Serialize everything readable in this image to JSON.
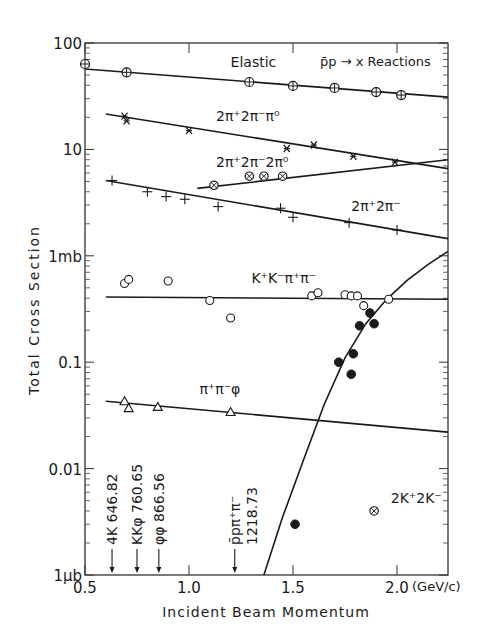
{
  "chart_data": {
    "type": "scatter",
    "title": "p̄p → x Reactions",
    "xlabel": "Incident Beam Momentum",
    "xunit": "(GeV/c)",
    "ylabel": "Total Cross Section",
    "xscale": "linear",
    "yscale": "log",
    "xlim": [
      0.5,
      2.245
    ],
    "ylim": [
      0.001,
      100
    ],
    "x_ticks": [
      {
        "value": 0.5,
        "label": "0.5"
      },
      {
        "value": 1.0,
        "label": "1.0"
      },
      {
        "value": 1.5,
        "label": "1.5"
      },
      {
        "value": 2.0,
        "label": "2.0"
      }
    ],
    "y_ticks": [
      {
        "value": 100,
        "label": "100"
      },
      {
        "value": 10,
        "label": "10"
      },
      {
        "value": 1,
        "label": "1mb"
      },
      {
        "value": 0.1,
        "label": "0.1"
      },
      {
        "value": 0.01,
        "label": "0.01"
      },
      {
        "value": 0.001,
        "label": "1μb"
      }
    ],
    "grid": false,
    "series": [
      {
        "name": "Elastic",
        "marker": "circle-plus",
        "label": {
          "text": "Elastic",
          "x": 1.2,
          "y": 60
        },
        "points": [
          [
            0.5,
            63.5
          ],
          [
            0.7,
            53
          ],
          [
            1.29,
            43
          ],
          [
            1.5,
            39.5
          ],
          [
            1.7,
            37.8
          ],
          [
            1.9,
            34.6
          ],
          [
            2.02,
            32.4
          ]
        ],
        "fit": [
          [
            0.5,
            57
          ],
          [
            2.245,
            31
          ]
        ]
      },
      {
        "name": "2π⁺2π⁻π⁰",
        "marker": "asterisk",
        "label": {
          "text": "2π⁺2π⁻π⁰",
          "x": 1.13,
          "y": 18.5
        },
        "points": [
          [
            0.69,
            20.5
          ],
          [
            0.7,
            18.5
          ],
          [
            1.0,
            15
          ],
          [
            1.47,
            10.2
          ],
          [
            1.6,
            11
          ],
          [
            1.79,
            8.6
          ],
          [
            1.99,
            7.6
          ]
        ],
        "fit": [
          [
            0.6,
            21.5
          ],
          [
            2.245,
            6.6
          ]
        ]
      },
      {
        "name": "2π⁺2π⁻2π⁰",
        "marker": "circle-x",
        "label": {
          "text": "2π⁺2π⁻2π⁰",
          "x": 1.13,
          "y": 6.8
        },
        "points": [
          [
            1.12,
            4.6
          ],
          [
            1.29,
            5.6
          ],
          [
            1.36,
            5.6
          ],
          [
            1.45,
            5.6
          ]
        ],
        "fit": [
          [
            1.04,
            4.3
          ],
          [
            2.245,
            8.0
          ]
        ]
      },
      {
        "name": "2π⁺2π⁻",
        "marker": "plus",
        "label": {
          "text": "2π⁺2π⁻",
          "x": 1.78,
          "y": 2.65
        },
        "points": [
          [
            0.63,
            5.1
          ],
          [
            0.8,
            4.0
          ],
          [
            0.89,
            3.6
          ],
          [
            0.98,
            3.4
          ],
          [
            1.14,
            2.9
          ],
          [
            1.44,
            2.8
          ],
          [
            1.5,
            2.3
          ],
          [
            1.77,
            2.05
          ],
          [
            2.0,
            1.75
          ]
        ],
        "fit": [
          [
            0.6,
            5.1
          ],
          [
            2.245,
            1.45
          ]
        ]
      },
      {
        "name": "K⁺K⁻π⁺π⁻",
        "marker": "open-circle",
        "label": {
          "text": "K⁺K⁻π⁺π⁻",
          "x": 1.3,
          "y": 0.55
        },
        "points": [
          [
            0.69,
            0.55
          ],
          [
            0.71,
            0.6
          ],
          [
            0.9,
            0.58
          ],
          [
            1.1,
            0.38
          ],
          [
            1.2,
            0.26
          ],
          [
            1.59,
            0.42
          ],
          [
            1.62,
            0.45
          ],
          [
            1.75,
            0.43
          ],
          [
            1.78,
            0.42
          ],
          [
            1.81,
            0.42
          ],
          [
            1.84,
            0.34
          ],
          [
            1.96,
            0.39
          ]
        ],
        "fit": [
          [
            0.6,
            0.41
          ],
          [
            2.245,
            0.39
          ]
        ]
      },
      {
        "name": "π⁺π⁻φ",
        "marker": "triangle",
        "label": {
          "text": "π⁺π⁻φ",
          "x": 1.05,
          "y": 0.05
        },
        "points": [
          [
            0.69,
            0.043
          ],
          [
            0.71,
            0.037
          ],
          [
            0.85,
            0.038
          ],
          [
            1.2,
            0.034
          ]
        ],
        "fit": [
          [
            0.6,
            0.043
          ],
          [
            2.245,
            0.022
          ]
        ]
      },
      {
        "name": "filled-circles (threshold reaction)",
        "marker": "filled-circle",
        "label": null,
        "points": [
          [
            1.51,
            0.003
          ],
          [
            1.72,
            0.1
          ],
          [
            1.78,
            0.077
          ],
          [
            1.79,
            0.12
          ],
          [
            1.82,
            0.22
          ],
          [
            1.87,
            0.29
          ],
          [
            1.89,
            0.23
          ]
        ],
        "fit_curve": [
          [
            1.36,
            0.001
          ],
          [
            1.45,
            0.0035
          ],
          [
            1.55,
            0.012
          ],
          [
            1.65,
            0.04
          ],
          [
            1.75,
            0.11
          ],
          [
            1.85,
            0.23
          ],
          [
            1.95,
            0.39
          ],
          [
            2.05,
            0.59
          ],
          [
            2.15,
            0.83
          ],
          [
            2.245,
            1.1
          ]
        ]
      },
      {
        "name": "2K⁺2K⁻",
        "marker": "circle-x",
        "label": {
          "text": "2K⁺2K⁻",
          "x": 1.97,
          "y": 0.0047
        },
        "points": [
          [
            1.89,
            0.004
          ]
        ]
      }
    ],
    "thresholds": [
      {
        "label": "4K 646.82",
        "x": 0.63
      },
      {
        "label": "KKφ 760.65",
        "x": 0.75
      },
      {
        "label": "φφ 866.56",
        "x": 0.855
      },
      {
        "label": "p̄pπ⁺π⁻ 1218.73",
        "x": 1.22
      }
    ]
  }
}
